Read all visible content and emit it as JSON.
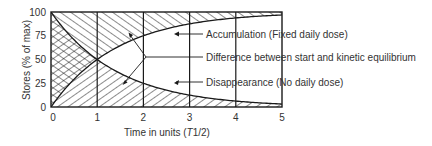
{
  "colors": {
    "ink": "#1a1a1a",
    "text": "#333333",
    "background": "#ffffff"
  },
  "chart_data": {
    "type": "line",
    "title": "",
    "xlabel": "Time in units (T1/2)",
    "xlabel_parts": [
      "Time in units (",
      "T",
      "1/2)"
    ],
    "ylabel": "Stores (% of max)",
    "xlim": [
      0,
      5
    ],
    "ylim": [
      0,
      100
    ],
    "x_ticks": [
      0,
      1,
      2,
      3,
      4,
      5
    ],
    "x_tick_labels": [
      "0",
      "1",
      "2",
      "3",
      "4",
      "5"
    ],
    "y_ticks": [
      0,
      25,
      50,
      75,
      100
    ],
    "y_tick_labels": [
      "0",
      "25",
      "50",
      "75",
      "100"
    ],
    "grid": "vertical lines at each x tick",
    "x": [
      0,
      1,
      2,
      3,
      4,
      5
    ],
    "series": [
      {
        "name": "Accumulation (Fixed daily dose)",
        "fill": "hatched area above the curve (/ diagonal)",
        "values": [
          0,
          50,
          75,
          87.5,
          93.75,
          96.875
        ]
      },
      {
        "name": "Disappearance (No daily dose)",
        "fill": "hatched area below the curve (\\ diagonal)",
        "values": [
          100,
          50,
          25,
          12.5,
          6.25,
          3.125
        ]
      }
    ],
    "annotations": [
      {
        "text": "Accumulation (Fixed daily dose)",
        "points_to": "accumulation region",
        "at_x": 2.7
      },
      {
        "text": "Difference between start and kinetic equilibrium",
        "points_to": "gap between the two curves",
        "at_x": 2
      },
      {
        "text": "Disappearance (No daily dose)",
        "points_to": "disappearance region",
        "at_x": 2.7
      }
    ],
    "legend": "none (inline annotations on right)"
  }
}
